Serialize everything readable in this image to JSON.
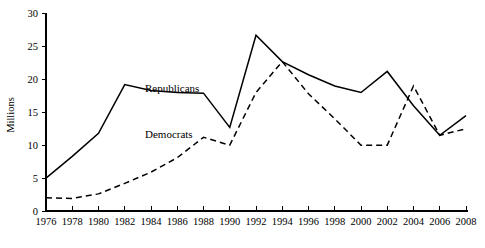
{
  "chart_data": {
    "type": "line",
    "title": "",
    "xlabel": "",
    "ylabel": "Millions",
    "x": [
      1976,
      1978,
      1980,
      1982,
      1984,
      1986,
      1988,
      1990,
      1992,
      1994,
      1996,
      1998,
      2000,
      2002,
      2004,
      2006,
      2008
    ],
    "xtick_labels": [
      "1976",
      "1978",
      "1980",
      "1982",
      "1984",
      "1986",
      "1988",
      "1990",
      "1992",
      "1994",
      "1996",
      "1998",
      "2000",
      "2002",
      "2004",
      "2006",
      "2008"
    ],
    "ytick_labels": [
      "0",
      "5",
      "10",
      "15",
      "20",
      "25",
      "30"
    ],
    "yticks": [
      0,
      5,
      10,
      15,
      20,
      25,
      30
    ],
    "xlim": [
      1976,
      2008
    ],
    "ylim": [
      0,
      30
    ],
    "grid": false,
    "legend_position": "inline-annotation",
    "series": [
      {
        "name": "Republicans",
        "style": "solid",
        "label_text": "Republicans",
        "values": [
          5.0,
          8.3,
          11.8,
          19.2,
          18.3,
          18.0,
          17.9,
          12.7,
          26.7,
          22.7,
          20.7,
          19.0,
          18.0,
          21.2,
          16.0,
          11.5,
          14.5
        ]
      },
      {
        "name": "Democrats",
        "style": "dashed",
        "label_text": "Democrats",
        "values": [
          2.0,
          1.9,
          2.6,
          4.2,
          5.9,
          8.1,
          11.2,
          10.0,
          18.0,
          22.7,
          17.8,
          14.0,
          10.0,
          10.0,
          19.0,
          11.5,
          12.5
        ]
      }
    ]
  },
  "labels": {
    "republicans": "Republicans",
    "democrats": "Democrats",
    "y_axis_title": "Millions"
  },
  "colors": {
    "line": "#000000",
    "axis": "#000000",
    "background": "#ffffff"
  }
}
